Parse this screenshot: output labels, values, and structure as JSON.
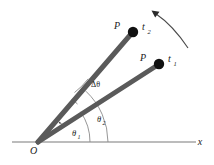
{
  "figure": {
    "background": "#ffffff",
    "colors": {
      "ray": "#5a5a5a",
      "point": "#111111",
      "axis": "#7a7a7a",
      "arc": "#8a8a8a",
      "text": "#1a1a1a",
      "arrow": "#3a3a3a"
    },
    "labels": {
      "origin": "O",
      "axis_x": "x",
      "point_upper": "P",
      "point_lower": "P",
      "time_upper": "t",
      "time_upper_sub": "2",
      "time_lower": "t",
      "time_lower_sub": "1",
      "delta_theta": "Δθ",
      "theta_one": "θ",
      "theta_one_sub": "1",
      "theta_two": "θ",
      "theta_two_sub": "2"
    },
    "geometry": {
      "origin_x": 38,
      "origin_y": 142,
      "axis_start_x": 12,
      "axis_end_x": 196,
      "axis_y": 142,
      "ray_t1_end_x": 159,
      "ray_t1_end_y": 64,
      "ray_t2_end_x": 133,
      "ray_t2_end_y": 32,
      "dot_t1_x": 159,
      "dot_t1_y": 64,
      "dot_t2_x": 133,
      "dot_t2_y": 32,
      "dot_radius": 5.2,
      "ray_width": 5,
      "theta_one_deg": 35,
      "theta_two_deg": 47,
      "rotation_arrow_from_x": 188,
      "rotation_arrow_from_y": 47,
      "rotation_arrow_to_x": 153,
      "rotation_arrow_to_y": 11
    }
  }
}
